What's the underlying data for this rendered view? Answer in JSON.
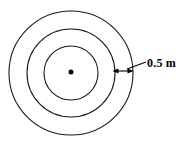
{
  "figure": {
    "kind": "concentric-circles-diagram",
    "background_color": "#ffffff",
    "stroke_color": "#1a1a1a",
    "center": {
      "x": 71,
      "y": 73
    },
    "center_dot": {
      "label": "center-point",
      "x": 71,
      "y": 72,
      "radius": 2.5,
      "fill_color": "#000000"
    },
    "circles": [
      {
        "label": "outer-circle",
        "radius": 62,
        "stroke_width": 1.1
      },
      {
        "label": "middle-circle",
        "radius": 44,
        "stroke_width": 1.1
      },
      {
        "label": "inner-circle",
        "radius": 27,
        "stroke_width": 1.1
      }
    ],
    "dimension": {
      "value_label": "0.5 m",
      "measures": "gap-between-middle-and-outer-circle",
      "arrow": {
        "x1": 113,
        "x2": 133,
        "y": 71,
        "double_headed": true
      },
      "leader_line": {
        "x1": 127,
        "y1": 69,
        "x2": 146,
        "y2": 62
      },
      "text_position": {
        "x": 147,
        "y": 56
      }
    }
  }
}
